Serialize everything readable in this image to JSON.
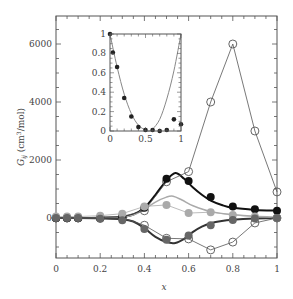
{
  "chart_data": [
    {
      "type": "line",
      "role": "main",
      "title": "",
      "xlabel": "x",
      "ylabel": "G_ij (cm³/mol)",
      "ylabel_parts": {
        "symbol": "G",
        "subscript": "ij",
        "units_pre": " (cm",
        "units_sup": "3",
        "units_post": "/mol)"
      },
      "xlim": [
        0,
        1
      ],
      "ylim": [
        -1400,
        6700
      ],
      "xticks": [
        0,
        0.2,
        0.4,
        0.6,
        0.8,
        1
      ],
      "xtick_labels": [
        "0",
        "0.2",
        "0.4",
        "0.6",
        "0.8",
        "1"
      ],
      "yticks": [
        0,
        2000,
        4000,
        6000
      ],
      "ytick_labels": [
        "0",
        "2000",
        "4000",
        "6000"
      ],
      "grid": false,
      "legend": null,
      "x": [
        0,
        0.05,
        0.1,
        0.2,
        0.3,
        0.4,
        0.5,
        0.6,
        0.7,
        0.8,
        0.9,
        1.0
      ],
      "series": [
        {
          "name": "open circles (upper, thin line)",
          "marker": "open-circle",
          "color": "#555555",
          "line": "thin-connect",
          "values": [
            0,
            0,
            0,
            0,
            50,
            250,
            1250,
            1600,
            4000,
            6000,
            3000,
            900
          ]
        },
        {
          "name": "open circles (lower, thin line)",
          "marker": "open-circle",
          "color": "#555555",
          "line": "thin-connect",
          "values": [
            0,
            0,
            0,
            0,
            0,
            -250,
            -700,
            -720,
            -1100,
            -830,
            -170,
            0
          ]
        },
        {
          "name": "black filled circles",
          "marker": "filled-circle",
          "color": "#111111",
          "values": [
            0,
            0,
            0,
            0,
            30,
            350,
            1350,
            1280,
            720,
            400,
            300,
            250
          ]
        },
        {
          "name": "light gray filled circles",
          "marker": "filled-circle",
          "color": "#aaaaaa",
          "line": "thin-connect",
          "values": [
            50,
            50,
            50,
            80,
            150,
            400,
            450,
            170,
            200,
            100,
            50,
            0
          ]
        },
        {
          "name": "dark gray filled circles",
          "marker": "filled-circle",
          "color": "#666666",
          "values": [
            0,
            0,
            0,
            -30,
            -80,
            -380,
            -750,
            -600,
            -250,
            -70,
            -20,
            0
          ]
        }
      ],
      "fit_curves": [
        {
          "name": "black fit (thick)",
          "color": "#111111",
          "width": 2,
          "x": [
            0,
            0.1,
            0.2,
            0.3,
            0.35,
            0.4,
            0.45,
            0.5,
            0.54,
            0.58,
            0.62,
            0.66,
            0.7,
            0.75,
            0.8,
            0.9,
            1.0
          ],
          "y": [
            0,
            0,
            10,
            40,
            120,
            350,
            800,
            1300,
            1550,
            1350,
            1050,
            800,
            600,
            450,
            350,
            280,
            260
          ]
        },
        {
          "name": "light gray fit",
          "color": "#aaaaaa",
          "width": 1.5,
          "x": [
            0,
            0.1,
            0.2,
            0.3,
            0.35,
            0.4,
            0.45,
            0.5,
            0.53,
            0.57,
            0.62,
            0.7,
            0.8,
            0.9,
            1.0
          ],
          "y": [
            0,
            0,
            10,
            30,
            100,
            300,
            550,
            720,
            750,
            620,
            420,
            220,
            120,
            60,
            30
          ]
        },
        {
          "name": "dark gray fit (thick, negative)",
          "color": "#333333",
          "width": 2,
          "x": [
            0,
            0.1,
            0.2,
            0.3,
            0.35,
            0.4,
            0.45,
            0.5,
            0.54,
            0.58,
            0.62,
            0.66,
            0.7,
            0.75,
            0.8,
            0.9,
            1.0
          ],
          "y": [
            0,
            0,
            -10,
            -40,
            -120,
            -350,
            -650,
            -830,
            -860,
            -720,
            -480,
            -300,
            -180,
            -100,
            -60,
            -20,
            0
          ]
        }
      ]
    },
    {
      "type": "scatter",
      "role": "inset",
      "title": "",
      "xlim": [
        0,
        1
      ],
      "ylim": [
        0,
        1
      ],
      "xticks": [
        0,
        0.5,
        1
      ],
      "xtick_labels": [
        "0",
        "0.5",
        "1"
      ],
      "yticks": [
        0,
        0.2,
        0.4,
        0.6,
        0.8,
        1
      ],
      "ytick_labels": [
        "0",
        "0.2",
        "0.4",
        "0.6",
        "0.8",
        "1"
      ],
      "points": {
        "x": [
          0,
          0.04,
          0.1,
          0.2,
          0.3,
          0.4,
          0.5,
          0.6,
          0.7,
          0.8,
          0.9,
          1.0
        ],
        "y": [
          1.0,
          0.81,
          0.66,
          0.34,
          0.15,
          0.04,
          0.01,
          0.01,
          0.0,
          0.01,
          0.12,
          0.07
        ]
      },
      "curve": {
        "color": "#888888",
        "x": [
          0,
          0.1,
          0.2,
          0.3,
          0.4,
          0.5,
          0.55,
          0.6,
          0.7,
          0.8,
          0.9,
          1.0
        ],
        "y": [
          1.0,
          0.66,
          0.38,
          0.18,
          0.06,
          0.01,
          0.0,
          0.02,
          0.12,
          0.33,
          0.62,
          1.0
        ]
      }
    }
  ]
}
